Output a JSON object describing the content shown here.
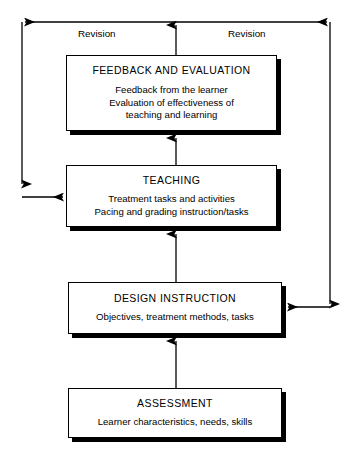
{
  "diagram": {
    "colors": {
      "line": "#000000",
      "box_fill": "#ffffff",
      "shadow": "#000000"
    },
    "nodes": [
      {
        "id": "feedback",
        "title": "FEEDBACK AND EVALUATION",
        "lines": [
          "Feedback from the learner",
          "Evaluation of effectiveness of",
          "teaching and learning"
        ]
      },
      {
        "id": "teaching",
        "title": "TEACHING",
        "lines": [
          "Treatment tasks and activities",
          "Pacing and grading instruction/tasks"
        ]
      },
      {
        "id": "design",
        "title": "DESIGN INSTRUCTION",
        "lines": [
          "Objectives, treatment methods, tasks"
        ]
      },
      {
        "id": "assessment",
        "title": "ASSESSMENT",
        "lines": [
          "Learner characteristics, needs, skills"
        ]
      }
    ],
    "edge_labels": {
      "revision_left": "Revision",
      "revision_right": "Revision"
    },
    "connectors": [
      {
        "id": "assessment-to-design",
        "from": "assessment",
        "to": "design",
        "direction": "up"
      },
      {
        "id": "design-to-teaching",
        "from": "design",
        "to": "teaching",
        "direction": "up"
      },
      {
        "id": "teaching-to-feedback",
        "from": "teaching",
        "to": "feedback",
        "direction": "up"
      },
      {
        "id": "feedback-to-revision-bus",
        "from": "feedback",
        "to": "revision-bus",
        "direction": "up"
      },
      {
        "id": "revision-left-to-teaching",
        "from": "revision-bus",
        "to": "teaching",
        "direction": "left-down-right"
      },
      {
        "id": "revision-right-to-design",
        "from": "revision-bus",
        "to": "design",
        "direction": "right-down-left"
      }
    ]
  }
}
